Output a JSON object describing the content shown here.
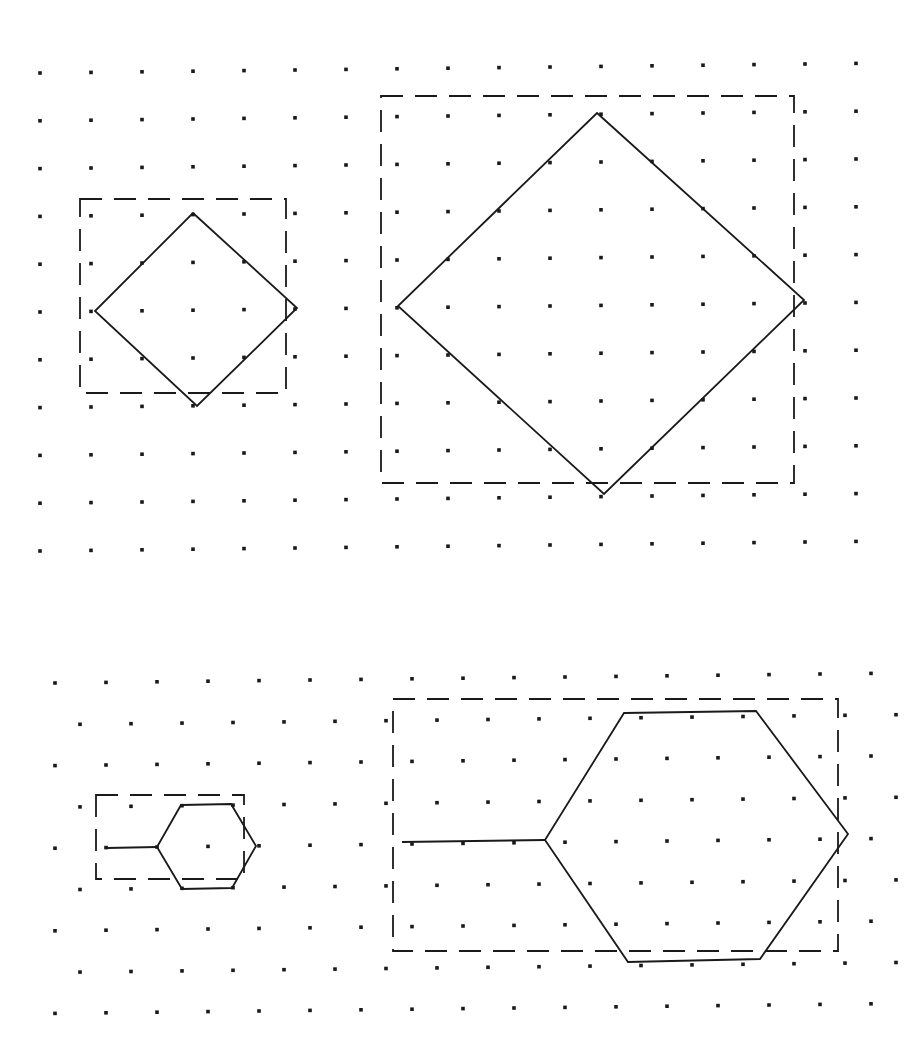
{
  "diagram": {
    "colors": {
      "ink": "#1a1a1a",
      "background": "#ffffff"
    },
    "grids": [
      {
        "name": "square-dot-grid",
        "type": "square",
        "origin": [
          40,
          73
        ],
        "spacing": 51,
        "row_spacing": 47.8,
        "rows": 11,
        "cols": 17,
        "row_tilt": -1.0
      },
      {
        "name": "triangular-dot-grid",
        "type": "triangular",
        "origin": [
          55,
          683
        ],
        "spacing": 51,
        "row_spacing": 41.3,
        "rows": 9,
        "cols": 17,
        "odd_row_offset": 25,
        "row_tilt": -1.0
      }
    ],
    "figures": [
      {
        "name": "small-diamond",
        "shape": "diamond",
        "points": [
          [
            193,
            213
          ],
          [
            297,
            308
          ],
          [
            197,
            406
          ],
          [
            95,
            311
          ]
        ],
        "bounding_box": {
          "x": 80,
          "y": 199,
          "w": 206,
          "h": 194
        }
      },
      {
        "name": "large-diamond",
        "shape": "diamond",
        "points": [
          [
            597,
            113
          ],
          [
            804,
            300
          ],
          [
            604,
            494
          ],
          [
            398,
            306
          ]
        ],
        "bounding_box": {
          "x": 381,
          "y": 96,
          "w": 413,
          "h": 387
        }
      },
      {
        "name": "small-hexagon",
        "shape": "hexagon",
        "points": [
          [
            181,
            805
          ],
          [
            231,
            804
          ],
          [
            256,
            846
          ],
          [
            232,
            888
          ],
          [
            182,
            889
          ],
          [
            157,
            847
          ]
        ],
        "lead_line": [
          [
            107,
            848
          ],
          [
            157,
            847
          ]
        ],
        "bounding_box": {
          "x": 96,
          "y": 795,
          "w": 148,
          "h": 84
        }
      },
      {
        "name": "large-hexagon",
        "shape": "hexagon",
        "points": [
          [
            624,
            713
          ],
          [
            756,
            711
          ],
          [
            848,
            834
          ],
          [
            760,
            959
          ],
          [
            628,
            962
          ],
          [
            545,
            840
          ]
        ],
        "lead_line": [
          [
            402,
            842
          ],
          [
            545,
            840
          ]
        ],
        "bounding_box": {
          "x": 393,
          "y": 699,
          "w": 445,
          "h": 252
        }
      }
    ]
  }
}
